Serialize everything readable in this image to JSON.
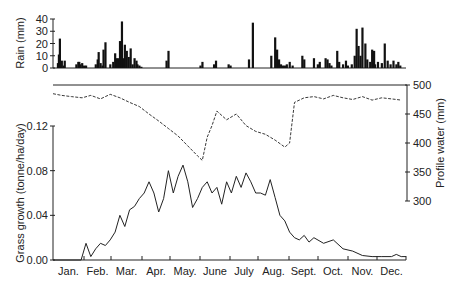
{
  "chart_data": [
    {
      "panel": "rain",
      "type": "bar",
      "ylabel": "Rain (mm)",
      "ylim": [
        0,
        40
      ],
      "yticks": [
        0,
        10,
        20,
        30,
        40
      ],
      "days": [
        6,
        7,
        8,
        10,
        12,
        13,
        25,
        27,
        28,
        29,
        31,
        33,
        35,
        45,
        47,
        48,
        50,
        52,
        53,
        55,
        60,
        63,
        65,
        66,
        68,
        70,
        72,
        74,
        75,
        77,
        79,
        81,
        83,
        85,
        87,
        88,
        90,
        92,
        118,
        120,
        153,
        155,
        167,
        169,
        182,
        184,
        203,
        207,
        226,
        230,
        232,
        234,
        236,
        238,
        240,
        242,
        245,
        248,
        258,
        260,
        270,
        274,
        276,
        282,
        284,
        286,
        288,
        294,
        296,
        300,
        303,
        305,
        309,
        312,
        314,
        316,
        318,
        320,
        323,
        325,
        328,
        330,
        332,
        333,
        336,
        340,
        343,
        346,
        349,
        352,
        355,
        357,
        359
      ],
      "values": [
        4,
        11,
        24,
        6,
        2,
        6,
        3,
        5,
        5,
        3,
        4,
        2,
        2,
        3,
        7,
        13,
        4,
        2,
        15,
        21,
        3,
        5,
        12,
        8,
        8,
        22,
        38,
        8,
        19,
        14,
        9,
        16,
        3,
        8,
        6,
        3,
        2,
        1,
        6,
        14,
        2,
        5,
        3,
        6,
        3,
        2,
        7,
        37,
        10,
        25,
        15,
        7,
        3,
        2,
        2,
        3,
        5,
        2,
        10,
        7,
        8,
        3,
        5,
        8,
        7,
        4,
        2,
        14,
        5,
        3,
        6,
        2,
        3,
        10,
        32,
        18,
        10,
        33,
        20,
        7,
        5,
        15,
        14,
        3,
        5,
        4,
        20,
        6,
        3,
        6,
        3,
        5,
        2
      ],
      "month_labels": [
        "Jan.",
        "Feb.",
        "Mar.",
        "Apr.",
        "May.",
        "June",
        "July",
        "Aug.",
        "Sept.",
        "Oct.",
        "Nov.",
        "Dec."
      ]
    },
    {
      "panel": "profile_water",
      "type": "line",
      "style": "dashed",
      "ylabel": "Profile water (mm)",
      "ylim": [
        300,
        500
      ],
      "yticks": [
        300,
        350,
        400,
        450,
        500
      ],
      "axis_side": "right",
      "x_day": [
        1,
        10,
        20,
        31,
        40,
        50,
        60,
        70,
        80,
        90,
        100,
        110,
        120,
        130,
        140,
        150,
        155,
        160,
        165,
        170,
        180,
        190,
        200,
        210,
        220,
        230,
        240,
        245,
        250,
        260,
        270,
        280,
        290,
        300,
        310,
        320,
        330,
        340,
        350,
        360
      ],
      "values": [
        485,
        482,
        480,
        478,
        482,
        476,
        484,
        478,
        470,
        463,
        450,
        438,
        425,
        412,
        395,
        378,
        370,
        410,
        430,
        455,
        440,
        450,
        430,
        420,
        415,
        405,
        393,
        400,
        470,
        478,
        480,
        476,
        482,
        478,
        475,
        480,
        474,
        478,
        476,
        474
      ]
    },
    {
      "panel": "grass_growth",
      "type": "line",
      "style": "solid",
      "ylabel": "Grass growth (tonne/ha/day)",
      "ylim": [
        0,
        0.12
      ],
      "yticks": [
        0.0,
        0.04,
        0.08,
        0.12
      ],
      "x_day": [
        1,
        30,
        35,
        40,
        45,
        50,
        55,
        60,
        65,
        70,
        75,
        80,
        85,
        90,
        95,
        100,
        105,
        110,
        115,
        120,
        125,
        130,
        135,
        140,
        145,
        150,
        155,
        160,
        165,
        170,
        175,
        180,
        185,
        190,
        195,
        200,
        205,
        210,
        215,
        220,
        225,
        230,
        235,
        240,
        245,
        250,
        255,
        260,
        265,
        270,
        280,
        290,
        300,
        310,
        320,
        330,
        340,
        350,
        355,
        360,
        365
      ],
      "values": [
        0,
        0,
        0.015,
        0.003,
        0.01,
        0.015,
        0.013,
        0.018,
        0.025,
        0.04,
        0.03,
        0.045,
        0.048,
        0.055,
        0.06,
        0.07,
        0.06,
        0.043,
        0.055,
        0.08,
        0.06,
        0.075,
        0.085,
        0.07,
        0.047,
        0.055,
        0.065,
        0.07,
        0.06,
        0.065,
        0.05,
        0.07,
        0.06,
        0.075,
        0.065,
        0.078,
        0.07,
        0.06,
        0.06,
        0.058,
        0.072,
        0.056,
        0.04,
        0.035,
        0.025,
        0.02,
        0.018,
        0.022,
        0.016,
        0.02,
        0.015,
        0.018,
        0.01,
        0.008,
        0.004,
        0.003,
        0.003,
        0.003,
        0.005,
        0.003,
        0.003
      ],
      "xlabel": "",
      "month_labels": [
        "Jan.",
        "Feb.",
        "Mar.",
        "Apr.",
        "May.",
        "June",
        "July",
        "Aug.",
        "Sept.",
        "Oct.",
        "Nov.",
        "Dec."
      ]
    }
  ],
  "labels": {
    "rain_axis": "Rain (mm)",
    "grass_axis": "Grass growth (tonne/ha/day)",
    "water_axis": "Profile water (mm)"
  }
}
